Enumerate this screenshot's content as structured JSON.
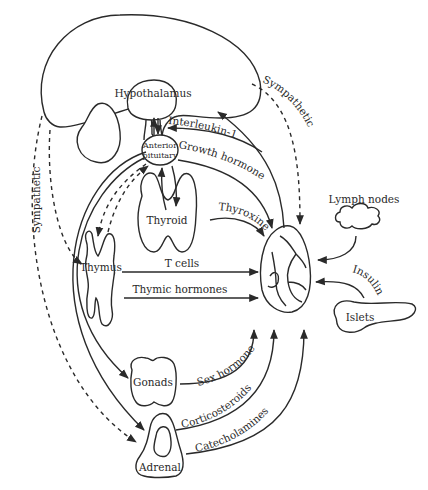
{
  "diagram": {
    "colors": {
      "stroke": "#2a2a2a",
      "background": "#ffffff"
    },
    "organs": {
      "hypothalamus": "Hypothalamus",
      "anterior_pituitary_line1": "Anterior",
      "anterior_pituitary_line2": "pituitary",
      "thyroid": "Thyroid",
      "thymus": "Thymus",
      "gonads": "Gonads",
      "adrenal": "Adrenal",
      "lymph_nodes": "Lymph nodes",
      "islets": "Islets"
    },
    "signals": {
      "interleukin": "Interleukin-1",
      "growth_hormone": "Growth hormone",
      "thyroxine": "Thyroxine",
      "t_cells": "T cells",
      "thymic_hormones": "Thymic hormones",
      "sex_hormone": "Sex hormone",
      "corticosteroids": "Corticosteroids",
      "catecholamines": "Catecholamines",
      "insulin": "Insulin",
      "sympathetic_left": "Sympathetic",
      "sympathetic_right": "Sympathetic"
    }
  }
}
